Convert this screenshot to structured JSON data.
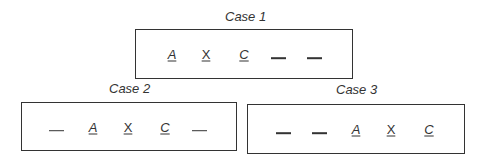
{
  "cases": [
    {
      "title": "Case 1",
      "slots": [
        {
          "type": "letter",
          "value": "A",
          "italic": true
        },
        {
          "type": "letter",
          "value": "X",
          "italic": false
        },
        {
          "type": "letter",
          "value": "C",
          "italic": true
        },
        {
          "type": "blank",
          "value": ""
        },
        {
          "type": "blank",
          "value": ""
        }
      ]
    },
    {
      "title": "Case 2",
      "slots": [
        {
          "type": "blank",
          "value": ""
        },
        {
          "type": "letter",
          "value": "A",
          "italic": true
        },
        {
          "type": "letter",
          "value": "X",
          "italic": false
        },
        {
          "type": "letter",
          "value": "C",
          "italic": true
        },
        {
          "type": "blank",
          "value": ""
        }
      ]
    },
    {
      "title": "Case 3",
      "slots": [
        {
          "type": "blank",
          "value": ""
        },
        {
          "type": "blank",
          "value": ""
        },
        {
          "type": "letter",
          "value": "A",
          "italic": true
        },
        {
          "type": "letter",
          "value": "X",
          "italic": false
        },
        {
          "type": "letter",
          "value": "C",
          "italic": true
        }
      ]
    }
  ]
}
